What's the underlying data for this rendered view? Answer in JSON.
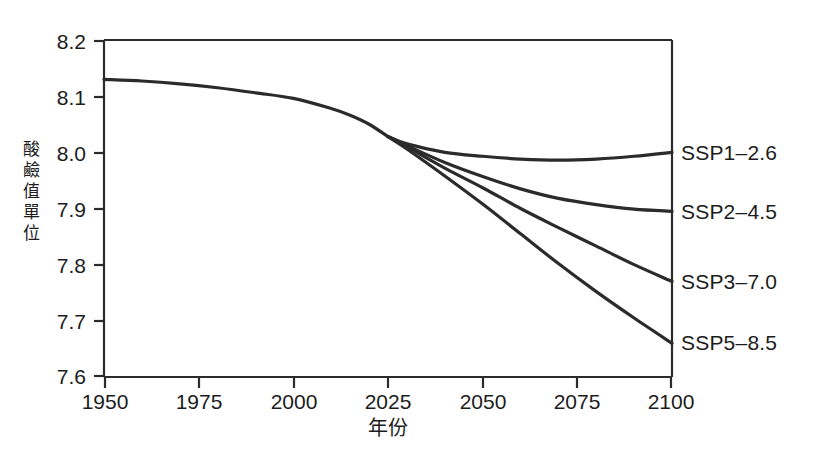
{
  "chart_data": {
    "type": "line",
    "title": "",
    "subtitle": "",
    "xlabel": "年份",
    "ylabel": "酸鹼值單位",
    "xlim": [
      1950,
      2100
    ],
    "ylim": [
      7.6,
      8.2
    ],
    "grid": false,
    "legend_position": "right-inline-labels",
    "xticks": [
      "1950",
      "1975",
      "2000",
      "2025",
      "2050",
      "2075",
      "2100"
    ],
    "xtick_values": [
      1950,
      1975,
      2000,
      2025,
      2050,
      2075,
      2100
    ],
    "yticks": [
      "7.6",
      "7.7",
      "7.8",
      "7.9",
      "8.0",
      "8.1",
      "8.2"
    ],
    "ytick_values": [
      7.6,
      7.7,
      7.8,
      7.9,
      8.0,
      8.1,
      8.2
    ],
    "line_color": "#2b2b2b",
    "background_color": "#ffffff",
    "axis_color": "#2b2b2b",
    "x": [
      1950,
      1960,
      1970,
      1980,
      1990,
      2000,
      2010,
      2015,
      2020,
      2025,
      2030,
      2040,
      2050,
      2060,
      2070,
      2080,
      2090,
      2100
    ],
    "historical": {
      "name": "Historical",
      "x": [
        1950,
        1960,
        1970,
        1980,
        1990,
        2000,
        2010,
        2015,
        2020,
        2025
      ],
      "values": [
        8.13,
        8.127,
        8.122,
        8.115,
        8.106,
        8.096,
        8.078,
        8.066,
        8.05,
        8.028
      ]
    },
    "series": [
      {
        "name": "SSP1-2.6",
        "label": "SSP1–2.6",
        "x": [
          2025,
          2030,
          2040,
          2050,
          2060,
          2070,
          2080,
          2090,
          2100
        ],
        "values": [
          8.028,
          8.015,
          8.0,
          7.993,
          7.988,
          7.986,
          7.988,
          7.993,
          8.0
        ],
        "end_value": 8.0
      },
      {
        "name": "SSP2-4.5",
        "label": "SSP2–4.5",
        "x": [
          2025,
          2030,
          2040,
          2050,
          2060,
          2070,
          2080,
          2090,
          2100
        ],
        "values": [
          8.028,
          8.012,
          7.982,
          7.957,
          7.935,
          7.918,
          7.907,
          7.899,
          7.895
        ],
        "end_value": 7.895
      },
      {
        "name": "SSP3-7.0",
        "label": "SSP3–7.0",
        "x": [
          2025,
          2030,
          2040,
          2050,
          2060,
          2070,
          2080,
          2090,
          2100
        ],
        "values": [
          8.028,
          8.01,
          7.972,
          7.937,
          7.9,
          7.866,
          7.833,
          7.8,
          7.77
        ],
        "end_value": 7.77
      },
      {
        "name": "SSP5-8.5",
        "label": "SSP5–8.5",
        "x": [
          2025,
          2030,
          2040,
          2050,
          2060,
          2070,
          2080,
          2090,
          2100
        ],
        "values": [
          8.028,
          8.006,
          7.958,
          7.908,
          7.855,
          7.802,
          7.752,
          7.705,
          7.66
        ],
        "end_value": 7.66
      }
    ]
  },
  "axes": {
    "y_title": "酸鹼值單位",
    "x_title": "年份",
    "ytick_0": "7.6",
    "ytick_1": "7.7",
    "ytick_2": "7.8",
    "ytick_3": "7.9",
    "ytick_4": "8.0",
    "ytick_5": "8.1",
    "ytick_6": "8.2",
    "xtick_0": "1950",
    "xtick_1": "1975",
    "xtick_2": "2000",
    "xtick_3": "2025",
    "xtick_4": "2050",
    "xtick_5": "2075",
    "xtick_6": "2100"
  },
  "series_labels": {
    "ssp1": "SSP1–2.6",
    "ssp2": "SSP2–4.5",
    "ssp3": "SSP3–7.0",
    "ssp5": "SSP5–8.5"
  }
}
